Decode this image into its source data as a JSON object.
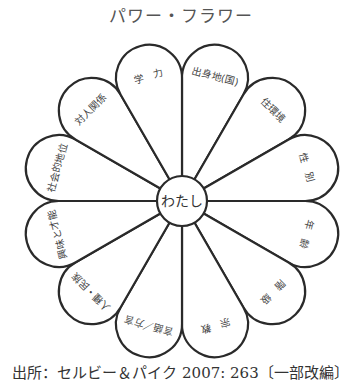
{
  "title": "パワー・フラワー",
  "center": {
    "label": "わたし",
    "cx": 182,
    "cy": 201,
    "r": 25
  },
  "petal_geometry": {
    "count": 12,
    "cap_center_distance": 127,
    "cap_radius": 33
  },
  "petals": [
    {
      "label": "出身地(国)",
      "angle": -75
    },
    {
      "label": "住環境",
      "angle": -45
    },
    {
      "label": "性　別",
      "angle": -15
    },
    {
      "label": "年　齢",
      "angle": 15
    },
    {
      "label": "階　級",
      "angle": 45
    },
    {
      "label": "宗　教",
      "angle": 75
    },
    {
      "label": "言語／方言",
      "angle": 105
    },
    {
      "label": "人種・民族",
      "angle": 135
    },
    {
      "label": "興味と才能",
      "angle": 165
    },
    {
      "label": "社会的地位",
      "angle": 195
    },
    {
      "label": "対人関係",
      "angle": 225
    },
    {
      "label": "学　力",
      "angle": 255
    }
  ],
  "caption": "出所：セルビー＆パイク 2007: 263〔一部改編〕"
}
